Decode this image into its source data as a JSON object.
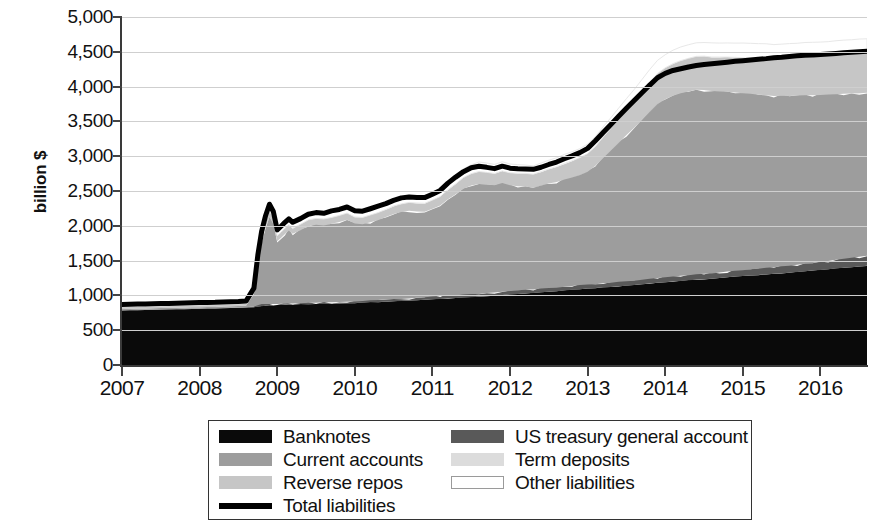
{
  "axes": {
    "ylabel": "billion $",
    "yticks": [
      "5,000",
      "4,500",
      "4,000",
      "3,500",
      "3,000",
      "2,500",
      "2,000",
      "1,500",
      "1,000",
      "500",
      "0"
    ],
    "xticks": [
      "2007",
      "2008",
      "2009",
      "2010",
      "2011",
      "2012",
      "2013",
      "2014",
      "2015",
      "2016"
    ]
  },
  "legend": {
    "items": [
      {
        "label": "Banknotes",
        "swatch": "solid",
        "color": "#0a0a0a",
        "column": 1
      },
      {
        "label": "US treasury general account",
        "swatch": "solid",
        "color": "#595959",
        "column": 2
      },
      {
        "label": "Current accounts",
        "swatch": "solid",
        "color": "#9d9d9d",
        "column": 1
      },
      {
        "label": "Term deposits",
        "swatch": "solid",
        "color": "#dcdcdc",
        "column": 2
      },
      {
        "label": "Reverse repos",
        "swatch": "solid",
        "color": "#c6c6c6",
        "column": 1
      },
      {
        "label": "Other liabilities",
        "swatch": "outline",
        "color": "#ffffff",
        "column": 2
      },
      {
        "label": "Total liabilities",
        "swatch": "line",
        "color": "#000000",
        "column": 1
      }
    ]
  },
  "chart_data": {
    "type": "area",
    "title": "",
    "xlabel": "",
    "ylabel": "billion $",
    "ylim": [
      0,
      5000
    ],
    "xlim": [
      2007.0,
      2016.6
    ],
    "grid": true,
    "legend_position": "bottom",
    "stacked": true,
    "colors": {
      "banknotes": "#0a0a0a",
      "us_treasury_general_account": "#595959",
      "current_accounts": "#9d9d9d",
      "term_deposits": "#dcdcdc",
      "reverse_repos": "#c6c6c6",
      "other_liabilities": "#ffffff",
      "total_liabilities": "#000000",
      "gridline": "#cfcfcf",
      "axis": "#3a3a3a"
    },
    "x": [
      2007.0,
      2007.1,
      2007.2,
      2007.3,
      2007.4,
      2007.5,
      2007.6,
      2007.7,
      2007.8,
      2007.9,
      2008.0,
      2008.1,
      2008.2,
      2008.3,
      2008.4,
      2008.5,
      2008.6,
      2008.7,
      2008.75,
      2008.8,
      2008.85,
      2008.9,
      2008.95,
      2009.0,
      2009.05,
      2009.1,
      2009.15,
      2009.2,
      2009.3,
      2009.4,
      2009.5,
      2009.6,
      2009.7,
      2009.8,
      2009.9,
      2010.0,
      2010.1,
      2010.2,
      2010.3,
      2010.4,
      2010.5,
      2010.6,
      2010.7,
      2010.8,
      2010.9,
      2011.0,
      2011.1,
      2011.2,
      2011.3,
      2011.4,
      2011.5,
      2011.6,
      2011.7,
      2011.8,
      2011.9,
      2012.0,
      2012.1,
      2012.2,
      2012.3,
      2012.4,
      2012.5,
      2012.6,
      2012.7,
      2012.8,
      2012.9,
      2013.0,
      2013.1,
      2013.2,
      2013.3,
      2013.4,
      2013.5,
      2013.6,
      2013.7,
      2013.8,
      2013.9,
      2014.0,
      2014.1,
      2014.2,
      2014.3,
      2014.4,
      2014.5,
      2014.6,
      2014.7,
      2014.8,
      2014.9,
      2015.0,
      2015.1,
      2015.2,
      2015.3,
      2015.4,
      2015.5,
      2015.6,
      2015.7,
      2015.8,
      2015.9,
      2016.0,
      2016.1,
      2016.2,
      2016.3,
      2016.4,
      2016.5,
      2016.6
    ],
    "series": [
      {
        "name": "Banknotes",
        "values": [
          783,
          786,
          788,
          790,
          792,
          795,
          798,
          800,
          802,
          805,
          808,
          810,
          812,
          815,
          818,
          820,
          825,
          830,
          838,
          845,
          850,
          855,
          860,
          862,
          864,
          866,
          868,
          870,
          872,
          874,
          876,
          878,
          880,
          884,
          888,
          892,
          896,
          900,
          905,
          910,
          915,
          920,
          926,
          932,
          938,
          944,
          950,
          956,
          962,
          968,
          974,
          980,
          988,
          996,
          1004,
          1012,
          1020,
          1028,
          1036,
          1044,
          1052,
          1060,
          1070,
          1080,
          1090,
          1098,
          1106,
          1114,
          1122,
          1130,
          1140,
          1150,
          1160,
          1170,
          1180,
          1190,
          1200,
          1208,
          1216,
          1224,
          1232,
          1240,
          1250,
          1260,
          1270,
          1278,
          1286,
          1294,
          1302,
          1310,
          1318,
          1326,
          1336,
          1346,
          1356,
          1366,
          1376,
          1386,
          1396,
          1406,
          1416,
          1426
        ]
      },
      {
        "name": "US treasury general account",
        "values": [
          5,
          5,
          5,
          5,
          5,
          5,
          5,
          5,
          5,
          5,
          5,
          5,
          5,
          5,
          5,
          5,
          5,
          10,
          20,
          30,
          25,
          20,
          15,
          15,
          15,
          15,
          15,
          15,
          15,
          20,
          20,
          25,
          20,
          20,
          20,
          20,
          25,
          30,
          30,
          35,
          35,
          30,
          30,
          35,
          35,
          40,
          40,
          45,
          40,
          45,
          45,
          40,
          45,
          45,
          50,
          50,
          50,
          55,
          50,
          55,
          55,
          50,
          55,
          55,
          60,
          60,
          55,
          60,
          60,
          65,
          65,
          60,
          65,
          70,
          70,
          70,
          70,
          75,
          75,
          80,
          80,
          75,
          80,
          85,
          85,
          85,
          90,
          90,
          95,
          95,
          100,
          100,
          105,
          110,
          110,
          115,
          120,
          125,
          130,
          135,
          140,
          145
        ]
      },
      {
        "name": "Current accounts",
        "values": [
          18,
          18,
          18,
          18,
          18,
          18,
          18,
          18,
          18,
          18,
          18,
          18,
          18,
          20,
          20,
          22,
          25,
          180,
          600,
          900,
          1100,
          1250,
          1150,
          900,
          950,
          1000,
          1050,
          1000,
          1050,
          1100,
          1120,
          1100,
          1130,
          1150,
          1180,
          1120,
          1100,
          1120,
          1150,
          1180,
          1220,
          1250,
          1260,
          1240,
          1230,
          1260,
          1300,
          1380,
          1450,
          1520,
          1560,
          1580,
          1560,
          1540,
          1560,
          1520,
          1500,
          1480,
          1460,
          1480,
          1500,
          1520,
          1540,
          1560,
          1580,
          1620,
          1700,
          1800,
          1900,
          2000,
          2100,
          2200,
          2300,
          2400,
          2500,
          2560,
          2600,
          2620,
          2640,
          2650,
          2640,
          2620,
          2600,
          2580,
          2560,
          2540,
          2520,
          2500,
          2480,
          2460,
          2450,
          2440,
          2430,
          2420,
          2410,
          2400,
          2390,
          2380,
          2370,
          2360,
          2350,
          2340
        ]
      },
      {
        "name": "Term deposits",
        "values": [
          0,
          0,
          0,
          0,
          0,
          0,
          0,
          0,
          0,
          0,
          0,
          0,
          0,
          0,
          0,
          0,
          0,
          0,
          0,
          0,
          0,
          0,
          0,
          0,
          0,
          0,
          0,
          0,
          0,
          0,
          0,
          0,
          0,
          0,
          0,
          0,
          0,
          0,
          0,
          0,
          0,
          0,
          0,
          0,
          0,
          0,
          0,
          0,
          0,
          0,
          0,
          0,
          0,
          0,
          0,
          0,
          0,
          0,
          0,
          0,
          0,
          0,
          0,
          0,
          0,
          0,
          0,
          0,
          0,
          0,
          0,
          0,
          0,
          0,
          0,
          0,
          0,
          0,
          0,
          0,
          0,
          0,
          0,
          0,
          0,
          0,
          0,
          0,
          0,
          0,
          0,
          0,
          0,
          0,
          0,
          0,
          0,
          0,
          0,
          0,
          0,
          0
        ]
      },
      {
        "name": "Reverse repos",
        "values": [
          30,
          30,
          30,
          30,
          30,
          30,
          30,
          30,
          30,
          30,
          30,
          30,
          30,
          30,
          30,
          30,
          30,
          40,
          60,
          70,
          80,
          90,
          90,
          80,
          80,
          85,
          85,
          80,
          85,
          90,
          90,
          95,
          90,
          95,
          95,
          95,
          100,
          105,
          105,
          110,
          115,
          115,
          120,
          120,
          120,
          125,
          130,
          140,
          150,
          160,
          170,
          180,
          175,
          170,
          175,
          180,
          185,
          190,
          195,
          200,
          210,
          220,
          230,
          240,
          250,
          260,
          280,
          300,
          320,
          340,
          360,
          380,
          400,
          420,
          440,
          450,
          460,
          470,
          475,
          480,
          485,
          490,
          495,
          500,
          505,
          510,
          515,
          520,
          525,
          530,
          535,
          540,
          545,
          550,
          555,
          560,
          565,
          570,
          575,
          580,
          585,
          590
        ]
      },
      {
        "name": "Other liabilities",
        "values": [
          34,
          35,
          34,
          34,
          35,
          34,
          34,
          35,
          35,
          35,
          36,
          36,
          36,
          36,
          36,
          36,
          38,
          45,
          60,
          80,
          90,
          95,
          90,
          85,
          85,
          84,
          82,
          85,
          83,
          84,
          86,
          84,
          87,
          86,
          87,
          88,
          89,
          90,
          92,
          93,
          95,
          96,
          98,
          100,
          102,
          105,
          108,
          112,
          118,
          125,
          130,
          135,
          132,
          130,
          128,
          126,
          124,
          122,
          120,
          122,
          124,
          126,
          128,
          130,
          132,
          134,
          140,
          146,
          152,
          158,
          164,
          170,
          176,
          182,
          188,
          190,
          192,
          194,
          196,
          198,
          200,
          202,
          204,
          206,
          208,
          210,
          210,
          210,
          210,
          210,
          210,
          208,
          206,
          204,
          202,
          200,
          198,
          196,
          194,
          192,
          190,
          188
        ]
      }
    ],
    "total_line": {
      "name": "Total liabilities",
      "values": [
        870,
        874,
        875,
        877,
        880,
        882,
        885,
        888,
        890,
        893,
        897,
        899,
        901,
        906,
        909,
        913,
        921,
        1105,
        1578,
        1925,
        2145,
        2310,
        2205,
        1942,
        1994,
        2050,
        2100,
        2050,
        2103,
        2166,
        2190,
        2180,
        2215,
        2235,
        2270,
        2215,
        2210,
        2245,
        2282,
        2318,
        2365,
        2401,
        2414,
        2407,
        2405,
        2454,
        2508,
        2613,
        2700,
        2778,
        2834,
        2855,
        2840,
        2821,
        2857,
        2828,
        2819,
        2815,
        2811,
        2841,
        2881,
        2916,
        2963,
        3005,
        3052,
        3112,
        3221,
        3340,
        3454,
        3573,
        3689,
        3800,
        3911,
        4022,
        4128,
        4190,
        4232,
        4257,
        4282,
        4302,
        4317,
        4327,
        4339,
        4351,
        4363,
        4373,
        4383,
        4394,
        4402,
        4415,
        4423,
        4434,
        4442,
        4450,
        4453,
        4461,
        4469,
        4477,
        4485,
        4493,
        4501,
        4509
      ]
    }
  }
}
